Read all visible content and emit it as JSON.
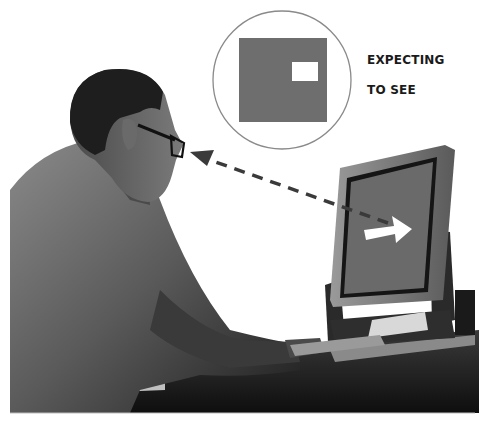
{
  "illustration": {
    "caption_line1": "EXPECTING",
    "caption_line2": "TO SEE",
    "bubble": {
      "description": "thought bubble showing expected screen: gray square with small white rectangle at upper right",
      "screen_color": "#6e6e6e",
      "highlight_color": "#ffffff",
      "outline_color": "#8a8a8a"
    },
    "monitor": {
      "screen_color": "#6a6a6a",
      "arrow_color": "#ffffff",
      "arrow_direction": "right"
    },
    "gaze_line": {
      "style": "dashed",
      "color": "#3a3a3a",
      "direction": "from monitor to eyes"
    },
    "person": {
      "description": "man with glasses seated at desk using keyboard, viewed from behind-side"
    }
  }
}
